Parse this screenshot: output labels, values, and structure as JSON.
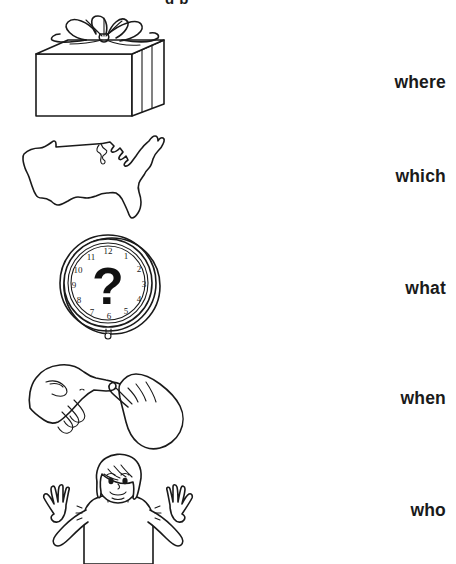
{
  "page": {
    "background_color": "#ffffff",
    "ink_color": "#1a1a1a",
    "width": 456,
    "height": 564,
    "cut_off_header_text": "g  p"
  },
  "rows": [
    {
      "index": 1,
      "picture_name": "gift-box-illustration",
      "picture_description": "wrapped present box with ribbon bow",
      "word": "where"
    },
    {
      "index": 2,
      "picture_name": "usa-map-illustration",
      "picture_description": "outline map of the continental United States",
      "word": "which"
    },
    {
      "index": 3,
      "picture_name": "clock-illustration",
      "picture_description": "round wall clock face with a question mark instead of hands",
      "word": "what"
    },
    {
      "index": 4,
      "picture_name": "hands-sign-illustration",
      "picture_description": "two hands making a sign-language gesture, index fingers touching",
      "word": "when"
    },
    {
      "index": 5,
      "picture_name": "shrugging-person-illustration",
      "picture_description": "child shrugging with both palms raised",
      "word": "who"
    }
  ],
  "clock": {
    "center_symbol": "?",
    "numerals": [
      "1",
      "2",
      "3",
      "4",
      "5",
      "6",
      "7",
      "8",
      "9",
      "10",
      "11",
      "12"
    ]
  }
}
